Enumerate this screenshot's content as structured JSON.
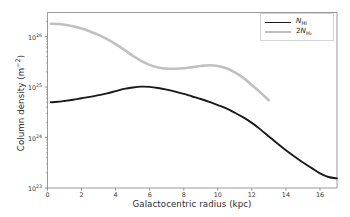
{
  "figure": {
    "background": "#ffffff"
  },
  "axes": {
    "xlabel": "Galactocentric radius (kpc)",
    "ylabel_text": "Column density (m",
    "ylabel_exp": "−2",
    "ylabel_tail": ")",
    "ylabel_full": "Column density (m−2)",
    "xticks": [
      "0",
      "2",
      "4",
      "6",
      "8",
      "10",
      "12",
      "14",
      "16"
    ],
    "ytick_mantissa": "10",
    "yticks_exp": [
      "23",
      "24",
      "25",
      "26"
    ],
    "yticks_full": [
      "10^23",
      "10^24",
      "10^25",
      "10^26"
    ],
    "spine_color": "#808080",
    "tick_color": "#808080"
  },
  "legend": {
    "position": "upper right",
    "border_color": "#d5d5d5",
    "entries": [
      {
        "name": "N",
        "sub": "HI",
        "prefix": "",
        "label_full": "N_HI",
        "color": "#1a1a1a",
        "linewidth": 1.9
      },
      {
        "name": "N",
        "sub": "H₂",
        "prefix": "2",
        "label_full": "2N_H2",
        "color": "#c0c0c0",
        "linewidth": 2.6
      }
    ]
  },
  "chart_data": {
    "type": "line",
    "title": "",
    "xlabel": "Galactocentric radius (kpc)",
    "ylabel": "Column density (m^-2)",
    "xscale": "linear",
    "yscale": "log",
    "xlim": [
      0,
      17
    ],
    "ylim": [
      1e+23,
      3e+26
    ],
    "grid": false,
    "legend_position": "upper right",
    "series": [
      {
        "name": "N_HI",
        "color": "#1a1a1a",
        "linewidth": 1.9,
        "x": [
          0.2,
          0.6,
          1.0,
          1.5,
          2.0,
          2.5,
          3.0,
          3.5,
          4.0,
          4.5,
          5.0,
          5.5,
          6.0,
          6.5,
          7.0,
          7.5,
          8.0,
          8.5,
          9.0,
          9.5,
          10.0,
          10.5,
          11.0,
          11.5,
          12.0,
          12.5,
          13.0,
          13.5,
          14.0,
          14.5,
          15.0,
          15.5,
          16.0,
          16.5,
          17.0
        ],
        "y": [
          5e+24,
          5.1e+24,
          5.3e+24,
          5.6e+24,
          6e+24,
          6.4e+24,
          6.9e+24,
          7.5e+24,
          8.3e+24,
          9.2e+24,
          9.8e+24,
          1.02e+25,
          1.01e+25,
          9.6e+24,
          8.9e+24,
          8.1e+24,
          7.3e+24,
          6.5e+24,
          5.8e+24,
          5.1e+24,
          4.4e+24,
          3.8e+24,
          3.1e+24,
          2.5e+24,
          1.95e+24,
          1.45e+24,
          1.05e+24,
          7.6e+23,
          5.6e+23,
          4.2e+23,
          3.2e+23,
          2.5e+23,
          1.95e+23,
          1.65e+23,
          1.55e+23
        ]
      },
      {
        "name": "2N_H2",
        "color": "#c0c0c0",
        "linewidth": 2.6,
        "x": [
          0.2,
          0.6,
          1.0,
          1.5,
          2.0,
          2.5,
          3.0,
          3.5,
          4.0,
          4.5,
          5.0,
          5.5,
          6.0,
          6.5,
          7.0,
          7.5,
          8.0,
          8.5,
          9.0,
          9.5,
          10.0,
          10.5,
          11.0,
          11.5,
          12.0,
          12.5,
          13.0
        ],
        "y": [
          1.8e+26,
          1.78e+26,
          1.72e+26,
          1.6e+26,
          1.44e+26,
          1.26e+26,
          1.08e+26,
          8.9e+25,
          7.1e+25,
          5.5e+25,
          4.2e+25,
          3.3e+25,
          2.75e+25,
          2.45e+25,
          2.32e+25,
          2.3e+25,
          2.35e+25,
          2.48e+25,
          2.62e+25,
          2.7e+25,
          2.62e+25,
          2.35e+25,
          1.95e+25,
          1.52e+25,
          1.1e+25,
          7.8e+24,
          5.5e+24
        ]
      }
    ]
  }
}
